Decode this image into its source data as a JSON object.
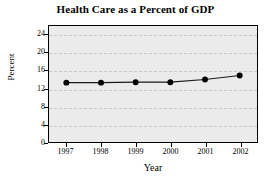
{
  "chart_data": {
    "type": "line",
    "title": "Health Care as a Percent of GDP",
    "xlabel": "Year",
    "ylabel": "Percent",
    "categories": [
      "1997",
      "1998",
      "1999",
      "2000",
      "2001",
      "2002"
    ],
    "x": [
      1997,
      1998,
      1999,
      2000,
      2001,
      2002
    ],
    "values": [
      13.3,
      13.3,
      13.4,
      13.4,
      14.0,
      14.9
    ],
    "series": [
      {
        "name": "Health care percent of GDP",
        "values": [
          13.3,
          13.3,
          13.4,
          13.4,
          14.0,
          14.9
        ]
      }
    ],
    "ylim": [
      0,
      26
    ],
    "y_ticks": [
      0,
      4,
      8,
      12,
      16,
      20,
      24
    ],
    "y_tick_labels": [
      "0",
      "4",
      "8",
      "12",
      "16",
      "20",
      "24"
    ],
    "xlim": [
      1996.5,
      2002.5
    ],
    "x_ticks": [
      1997,
      1998,
      1999,
      2000,
      2001,
      2002
    ],
    "x_tick_labels": [
      "1997",
      "1998",
      "1999",
      "2000",
      "2001",
      "2002"
    ],
    "grid": "horizontal-dashed",
    "legend": "none",
    "marker": "filled-circle",
    "colors": {
      "line": "#1a1a1a",
      "marker": "#000000",
      "plot_background": "#ebebeb",
      "gridline": "#c8c8c8",
      "axis": "#000000",
      "text": "#000000",
      "figure_background": "#ffffff"
    }
  }
}
